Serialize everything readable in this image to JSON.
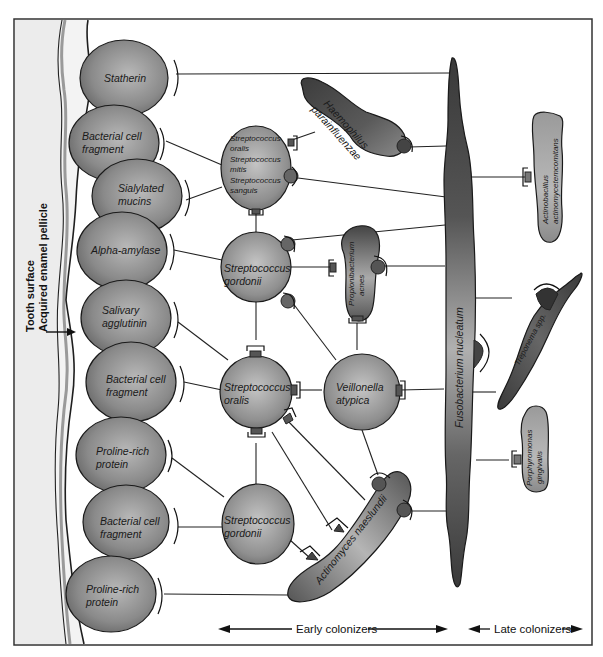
{
  "diagram": {
    "title_vertical": {
      "line1": "Tooth surface",
      "line2": "Acquired enamel pellicle"
    },
    "pellicle_receptors": [
      {
        "id": "statherin",
        "lines": [
          "Statherin"
        ]
      },
      {
        "id": "bcf1",
        "lines": [
          "Bacterial cell",
          "fragment"
        ]
      },
      {
        "id": "sialylated",
        "lines": [
          "Sialylated",
          "mucins"
        ]
      },
      {
        "id": "amylase",
        "lines": [
          "Alpha-amylase"
        ]
      },
      {
        "id": "agglutinin",
        "lines": [
          "Salivary",
          "agglutinin"
        ]
      },
      {
        "id": "bcf2",
        "lines": [
          "Bacterial cell",
          "fragment"
        ]
      },
      {
        "id": "prp1",
        "lines": [
          "Proline-rich",
          "protein"
        ]
      },
      {
        "id": "bcf3",
        "lines": [
          "Bacterial cell",
          "fragment"
        ]
      },
      {
        "id": "prp2",
        "lines": [
          "Proline-rich",
          "protein"
        ]
      }
    ],
    "early_colonizers": [
      {
        "id": "strep_group",
        "lines": [
          "Streptococcus",
          "oralis",
          "Streptococcus",
          "mitis",
          "Streptococcus",
          "sanguis"
        ]
      },
      {
        "id": "s_gordonii_1",
        "lines": [
          "Streptococcus",
          "gordonii"
        ]
      },
      {
        "id": "s_oralis",
        "lines": [
          "Streptococcus",
          "oralis"
        ]
      },
      {
        "id": "s_gordonii_2",
        "lines": [
          "Streptococcus",
          "gordonii"
        ]
      },
      {
        "id": "v_atypica",
        "lines": [
          "Veillonella",
          "atypica"
        ]
      },
      {
        "id": "haemophilus",
        "lines": [
          "Haemophilus",
          "parainfluenzae"
        ]
      },
      {
        "id": "propioni",
        "lines": [
          "Propionibacterium",
          "acnes"
        ]
      },
      {
        "id": "actinomyces",
        "lines": [
          "Actinomyces naeslundii"
        ]
      }
    ],
    "bridge": {
      "id": "fusobacterium",
      "label": "Fusobacterium nucleatum"
    },
    "late_colonizers": [
      {
        "id": "actinobacillus",
        "lines": [
          "Actinobacillus",
          "actinomycetemcomitans"
        ]
      },
      {
        "id": "treponema",
        "lines": [
          "Treponema spp."
        ]
      },
      {
        "id": "porphyromonas",
        "lines": [
          "Porphyromonas",
          "gingivalis"
        ]
      }
    ],
    "axis": {
      "early_label": "Early colonizers",
      "late_label": "Late colonizers"
    },
    "colors": {
      "tooth": "#ececec",
      "pellicle_band": "#9a9a9a",
      "wall_line": "#1e1e1e",
      "receptor_fill": "#8e8e8e",
      "bacteria_dark": "#4a4a4a",
      "bacteria_light": "#bdbdbd",
      "border": "#333333"
    }
  }
}
